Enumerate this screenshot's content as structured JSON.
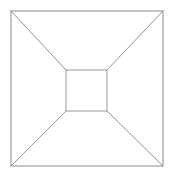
{
  "canvas": {
    "width": 173,
    "height": 176,
    "background_color": "#ffffff",
    "title": "One-point perspective box"
  },
  "style": {
    "outer_stroke_color": "#8c8c8c",
    "inner_stroke_color": "#9a9a9a",
    "diagonal_stroke_color": "#868686",
    "outer_stroke_width": 1,
    "inner_stroke_width": 1,
    "diagonal_stroke_width": 0.9
  },
  "chart_data": {
    "type": "line",
    "xlabel": "",
    "ylabel": "",
    "xlim": [
      0,
      173
    ],
    "ylim": [
      0,
      176
    ],
    "grid": false,
    "legend": "none",
    "shapes": [
      {
        "name": "outer-square",
        "kind": "rect",
        "x": 11,
        "y": 11,
        "width": 152,
        "height": 155,
        "points": [
          [
            11,
            11
          ],
          [
            163,
            11
          ],
          [
            163,
            166
          ],
          [
            11,
            166
          ]
        ]
      },
      {
        "name": "inner-square",
        "kind": "rect",
        "x": 66,
        "y": 70,
        "width": 41,
        "height": 41,
        "points": [
          [
            66,
            70
          ],
          [
            107,
            70
          ],
          [
            107,
            111
          ],
          [
            66,
            111
          ]
        ]
      }
    ],
    "series": [
      {
        "name": "diagonal-top-left",
        "points": [
          [
            11,
            11
          ],
          [
            66,
            70
          ]
        ]
      },
      {
        "name": "diagonal-top-right",
        "points": [
          [
            163,
            11
          ],
          [
            107,
            70
          ]
        ]
      },
      {
        "name": "diagonal-bottom-right",
        "points": [
          [
            163,
            166
          ],
          [
            107,
            111
          ]
        ]
      },
      {
        "name": "diagonal-bottom-left",
        "points": [
          [
            11,
            166
          ],
          [
            66,
            111
          ]
        ]
      }
    ]
  }
}
